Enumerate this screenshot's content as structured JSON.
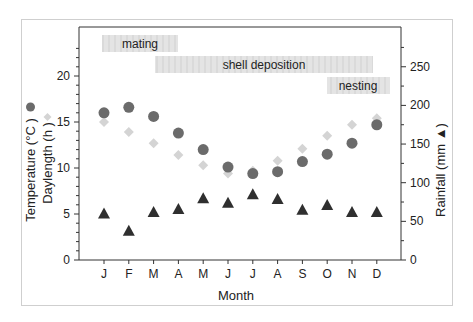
{
  "chart_data": {
    "type": "scatter",
    "title": "",
    "xlabel": "Month",
    "ylabel_left": "Temperature (°C ●) Daylength (h ◆)",
    "ylabel_left_lines": [
      "Temperature (°C",
      "Daylength (h"
    ],
    "ylabel_right": "Rainfall (mm ▲)",
    "categories": [
      "J",
      "F",
      "M",
      "A",
      "M",
      "J",
      "J",
      "A",
      "S",
      "O",
      "N",
      "D"
    ],
    "ylim_left": [
      0,
      25
    ],
    "yticks_left": [
      0,
      5,
      10,
      15,
      20
    ],
    "ylim_right": [
      0,
      300
    ],
    "yticks_right": [
      0,
      50,
      100,
      150,
      200,
      250
    ],
    "grid": false,
    "series": [
      {
        "name": "Temperature (°C)",
        "axis": "left",
        "marker": "circle",
        "color": "#6b6b6b",
        "values": [
          16.0,
          16.6,
          15.6,
          13.8,
          12.0,
          10.1,
          9.4,
          9.6,
          10.7,
          11.5,
          12.7,
          14.7
        ]
      },
      {
        "name": "Daylength (h)",
        "axis": "left",
        "marker": "diamond",
        "color": "#d4d4d4",
        "values": [
          15.0,
          13.9,
          12.7,
          11.4,
          10.3,
          9.4,
          9.7,
          10.8,
          12.1,
          13.5,
          14.7,
          15.4
        ]
      },
      {
        "name": "Rainfall (mm)",
        "axis": "right",
        "marker": "triangle",
        "color": "#2f2f2f",
        "values": [
          60,
          38,
          62,
          66,
          80,
          74,
          85,
          79,
          65,
          71,
          62,
          62
        ]
      }
    ],
    "annotations": [
      {
        "label": "mating",
        "start_month": "J",
        "end_month": "A"
      },
      {
        "label": "shell deposition",
        "start_month": "M",
        "end_month": "D"
      },
      {
        "label": "nesting",
        "start_month": "O",
        "end_month": "D"
      }
    ]
  }
}
